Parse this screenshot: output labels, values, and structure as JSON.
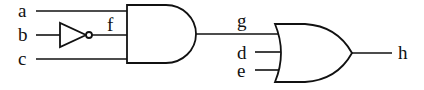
{
  "diagram": {
    "type": "logic-circuit",
    "inputs": [
      {
        "id": "a",
        "label": "a"
      },
      {
        "id": "b",
        "label": "b"
      },
      {
        "id": "c",
        "label": "c"
      },
      {
        "id": "d",
        "label": "d"
      },
      {
        "id": "e",
        "label": "e"
      }
    ],
    "intermediate": [
      {
        "id": "f",
        "label": "f",
        "description": "NOT b"
      },
      {
        "id": "g",
        "label": "g",
        "description": "AND(a, f, c)"
      }
    ],
    "output": {
      "id": "h",
      "label": "h",
      "description": "OR(g, d, e)"
    },
    "gates": [
      {
        "id": "not1",
        "type": "NOT",
        "inputs": [
          "b"
        ],
        "output": "f"
      },
      {
        "id": "and1",
        "type": "AND",
        "inputs": [
          "a",
          "f",
          "c"
        ],
        "output": "g"
      },
      {
        "id": "or1",
        "type": "OR",
        "inputs": [
          "g",
          "d",
          "e"
        ],
        "output": "h"
      }
    ],
    "colors": {
      "stroke": "#111111",
      "background": "#ffffff"
    }
  }
}
